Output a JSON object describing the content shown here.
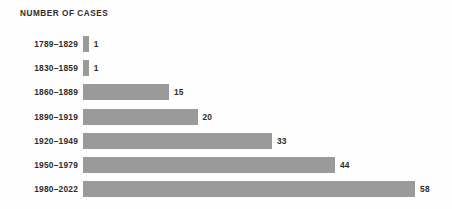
{
  "chart_data": {
    "type": "bar",
    "orientation": "horizontal",
    "title": "NUMBER OF CASES",
    "xlabel": "",
    "ylabel": "",
    "categories": [
      "1789–1829",
      "1830–1859",
      "1860–1889",
      "1890–1919",
      "1920–1949",
      "1950–1979",
      "1980–2022"
    ],
    "values": [
      1,
      1,
      15,
      20,
      33,
      44,
      58
    ],
    "value_labels": [
      "1",
      "1",
      "15",
      "20",
      "33",
      "44",
      "58"
    ],
    "xlim": [
      0,
      58
    ],
    "grid": false,
    "legend": null,
    "bars": [
      {
        "category": "1789–1829",
        "value": 1,
        "value_label": "1"
      },
      {
        "category": "1830–1859",
        "value": 1,
        "value_label": "1"
      },
      {
        "category": "1860–1889",
        "value": 15,
        "value_label": "15"
      },
      {
        "category": "1890–1919",
        "value": 20,
        "value_label": "20"
      },
      {
        "category": "1920–1949",
        "value": 33,
        "value_label": "33"
      },
      {
        "category": "1950–1979",
        "value": 44,
        "value_label": "44"
      },
      {
        "category": "1980–2022",
        "value": 58,
        "value_label": "58"
      }
    ],
    "colors": {
      "bar_fill": "#9a9a9a",
      "text": "#2d2d2d",
      "background": "#fefefe"
    }
  }
}
